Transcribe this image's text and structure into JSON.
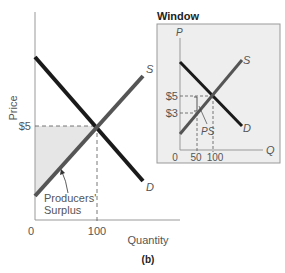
{
  "figure": {
    "caption": "(b)",
    "main": {
      "y_label": "Price",
      "x_label": "Quantity",
      "price_tick": "$5",
      "x_ticks": [
        "0",
        "100"
      ],
      "supply_label": "S",
      "demand_label": "D",
      "surplus_label_line1": "Producers'",
      "surplus_label_line2": "Surplus"
    },
    "window": {
      "title": "Window",
      "y_axis_label": "P",
      "x_axis_label": "Q",
      "price_ticks": [
        "$5",
        "$3"
      ],
      "x_ticks": [
        "0",
        "50",
        "100"
      ],
      "supply_label": "S",
      "demand_label": "D",
      "ps_label": "PS"
    },
    "colors": {
      "supply": "#555555",
      "demand": "#1a1a1a",
      "surplus_fill": "#e6e6e6",
      "window_fill": "#eeeeee",
      "axis": "#888888"
    }
  }
}
